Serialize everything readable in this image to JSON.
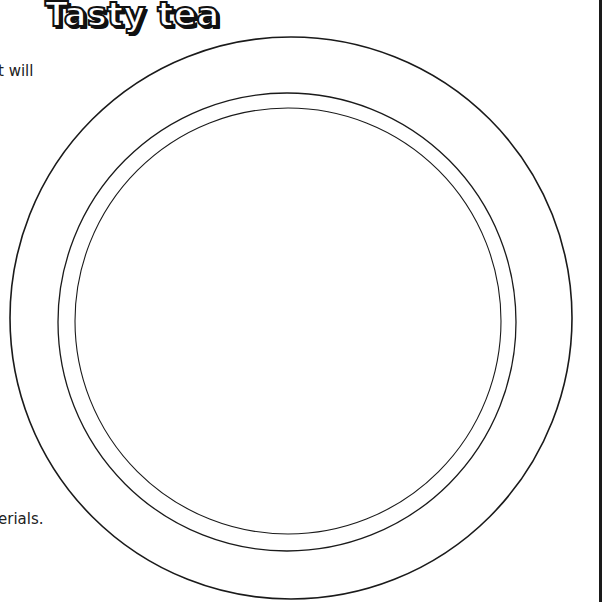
{
  "worksheet": {
    "title": "Tasty tea",
    "text_fragments": {
      "top": "t will",
      "bottom": "erials."
    }
  },
  "illustration": {
    "type": "plate-outline",
    "rings": [
      {
        "name": "outer-rim",
        "cx": 291,
        "cy": 318,
        "r": 281
      },
      {
        "name": "middle-ring",
        "cx": 287,
        "cy": 322,
        "r": 229
      },
      {
        "name": "inner-ring",
        "cx": 288,
        "cy": 321,
        "r": 213
      }
    ],
    "stroke_color": "#1a1a1a"
  }
}
